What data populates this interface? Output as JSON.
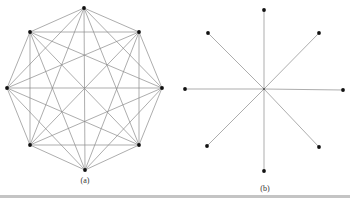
{
  "figure": {
    "panels": [
      {
        "id": "a",
        "caption": "(a)",
        "description": "Complete graph K8 on 8 vertices arranged as a regular octagon",
        "vertices": [
          [
            84,
            8
          ],
          [
            139,
            32
          ],
          [
            162,
            88
          ],
          [
            139,
            145
          ],
          [
            85,
            170
          ],
          [
            30,
            145
          ],
          [
            7,
            88
          ],
          [
            30,
            32
          ]
        ],
        "edges": "all-pairs"
      },
      {
        "id": "b",
        "caption": "(b)",
        "description": "Star graph: 8 outer vertices each connected to a central hub",
        "center": [
          264,
          89
        ],
        "vertices": [
          [
            264,
            10
          ],
          [
            319,
            33
          ],
          [
            343,
            90
          ],
          [
            319,
            147
          ],
          [
            264,
            171
          ],
          [
            207,
            146
          ],
          [
            185,
            89
          ],
          [
            208,
            33
          ]
        ],
        "edges": "hub-to-each"
      }
    ],
    "colors": {
      "edge": "#8a8a8a",
      "vertex": "#111111",
      "rule": "#c4c4c4"
    }
  }
}
